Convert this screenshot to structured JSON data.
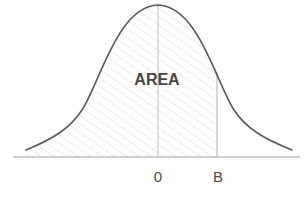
{
  "diagram": {
    "type": "normal-distribution-shaded-area",
    "area_label": "AREA",
    "axis_labels": {
      "mean": "0",
      "bound": "B"
    },
    "shaded_region": "left tail up to B",
    "colors": {
      "curve": "#5a5a5a",
      "axis": "#9a9a9a",
      "hatch": "#c4c4c4",
      "text": "#454545"
    }
  }
}
